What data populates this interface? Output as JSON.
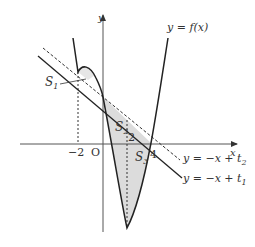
{
  "diagram": {
    "axes": {
      "x_label": "x",
      "y_label": "y",
      "origin_label": "O"
    },
    "ticks": {
      "x_neg2": "−2",
      "x_2": "2",
      "x_4": "4"
    },
    "curve_label": "y = f(x)",
    "line1_label": "y = −x + t",
    "line1_sub": "1",
    "line2_label": "y = −x + t",
    "line2_sub": "2",
    "regions": [
      {
        "name": "S",
        "sub": "1"
      },
      {
        "name": "S",
        "sub": "2"
      },
      {
        "name": "S",
        "sub": "3"
      }
    ],
    "colors": {
      "stroke": "#2a2a2a",
      "axis": "#555555",
      "fill": "#d9d9d9"
    }
  }
}
